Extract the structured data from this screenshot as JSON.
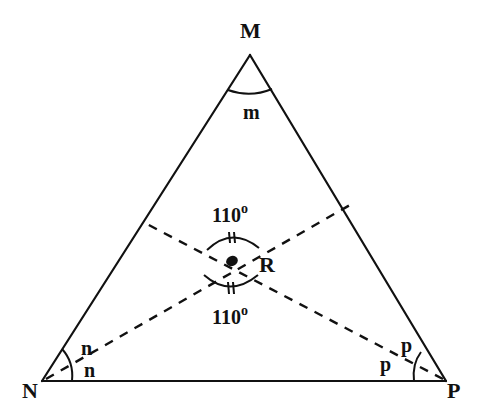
{
  "diagram": {
    "type": "geometry-triangle",
    "stroke_color": "#111111",
    "background": "#ffffff",
    "vertices": {
      "M": {
        "label": "M",
        "x": 250,
        "y": 55
      },
      "N": {
        "label": "N",
        "x": 42,
        "y": 381
      },
      "P": {
        "label": "P",
        "x": 446,
        "y": 381
      }
    },
    "intersection": {
      "label": "R",
      "x": 232,
      "y": 261
    },
    "angle_labels": {
      "at_M": "m",
      "at_N_upper": "n",
      "at_N_lower": "n",
      "at_P_upper": "p",
      "at_P_lower": "p"
    },
    "angle_at_R": {
      "top": {
        "value": "110",
        "unit": "o"
      },
      "bottom": {
        "value": "110",
        "unit": "o"
      }
    },
    "bisectors": [
      {
        "from": "N",
        "through": "R",
        "ends_on": "MP"
      },
      {
        "from": "P",
        "through": "R",
        "ends_on": "MN"
      }
    ]
  }
}
